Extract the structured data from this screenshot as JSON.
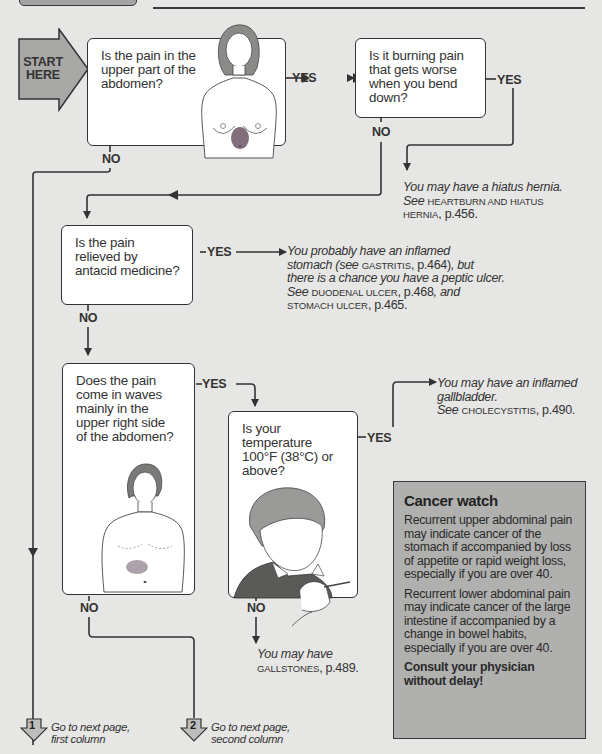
{
  "header": {
    "tab_label": "",
    "rule": true
  },
  "start": {
    "label_line1": "START",
    "label_line2": "HERE"
  },
  "questions": {
    "q1": {
      "lines": [
        "Is the pain in the",
        "upper part of the",
        "abdomen?"
      ],
      "yes_label": "YES",
      "no_label": "NO",
      "illustration": "woman-torso-upper-abdomen-pain"
    },
    "q2": {
      "lines": [
        "Is it burning pain",
        "that gets worse",
        "when you bend",
        "down?"
      ],
      "yes_label": "YES",
      "no_label": "NO"
    },
    "q3": {
      "lines": [
        "Is the pain",
        "relieved by",
        "antacid medicine?"
      ],
      "yes_label": "YES",
      "no_label": "NO"
    },
    "q4": {
      "lines": [
        "Does the pain",
        "come in waves",
        "mainly in the",
        "upper right side",
        "of the abdomen?"
      ],
      "yes_label": "YES",
      "no_label": "NO",
      "illustration": "man-torso-upper-right-pain"
    },
    "q5": {
      "lines": [
        "Is your",
        "temperature",
        "100°F (38°C) or",
        "above?"
      ],
      "yes_label": "YES",
      "no_label": "NO",
      "illustration": "person-with-thermometer"
    }
  },
  "results": {
    "hiatus": {
      "line1": "You may have a hiatus hernia.",
      "see": "See",
      "ref1": "HEARTBURN AND HIATUS",
      "ref2": "HERNIA",
      "page": ", p.456."
    },
    "gastritis": {
      "line1": "You probably have an inflamed",
      "line2_a": "stomach (see",
      "line2_ref": "GASTRITIS",
      "line2_page": ", p.464)",
      "line2_b": ", but",
      "line3": "there is a chance you have a peptic ulcer.",
      "line4_see": "See",
      "line4_ref": "DUODENAL ULCER",
      "line4_page": ", p.468",
      "line4_and": ", and",
      "line5_ref": "STOMACH ULCER",
      "line5_page": ", p.465."
    },
    "gallbladder": {
      "line1": "You may have an inflamed",
      "line2": "gallbladder.",
      "see": "See",
      "ref": "CHOLECYSTITIS",
      "page": ", p.490."
    },
    "gallstones": {
      "line1": "You may have",
      "ref": "GALLSTONES",
      "page": ", p.489."
    }
  },
  "cancer_watch": {
    "title": "Cancer watch",
    "para1": "Recurrent upper abdominal pain may indicate cancer of the stomach if accompanied by loss of appetite or rapid weight loss, especially if you are over 40.",
    "para2": "Recurrent lower abdominal pain may indicate cancer of the large intestine if accompanied by a change in bowel habits, especially if you are over 40.",
    "para3": "Consult your physician without delay!"
  },
  "continuations": [
    {
      "number": "1",
      "line1": "Go to next page,",
      "line2": "first column"
    },
    {
      "number": "2",
      "line1": "Go to next page,",
      "line2": "second column"
    }
  ],
  "colors": {
    "background": "#e6e6e4",
    "box_fill": "#ffffff",
    "line": "#333333",
    "start_arrow_fill": "#a8a8a6",
    "cancer_box_fill": "#b0b0ae",
    "continuation_arrow_fill": "#bdbdbb"
  }
}
